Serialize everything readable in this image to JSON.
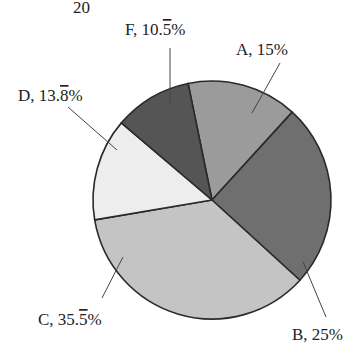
{
  "chart_data": {
    "type": "pie",
    "title": "",
    "top_fragment_text": "20",
    "center": [
      212,
      200
    ],
    "radius": 119,
    "start_angle_deg": -11.6,
    "direction": "clockwise",
    "slices": [
      {
        "label": "A",
        "value": 15.0,
        "display": "A, 15%",
        "color": "#9b9b9b"
      },
      {
        "label": "B",
        "value": 25.0,
        "display": "B, 25%",
        "color": "#6f6f6f"
      },
      {
        "label": "C",
        "value": 35.56,
        "display": "C, 35.5̅%",
        "color": "#c4c4c4"
      },
      {
        "label": "D",
        "value": 13.89,
        "display": "D, 13.8̅%",
        "color": "#ededed"
      },
      {
        "label": "F",
        "value": 10.56,
        "display": "F, 10.5̅%",
        "color": "#555555"
      }
    ],
    "labels": [
      {
        "slice": "A",
        "text_main": "A, 15%",
        "text_x": 236,
        "text_y": 55,
        "line": [
          280,
          63,
          252,
          113
        ]
      },
      {
        "slice": "B",
        "text_main": "B, 25%",
        "text_x": 292,
        "text_y": 340,
        "line": [
          326,
          317,
          303,
          262
        ]
      },
      {
        "slice": "C",
        "text_main": "C, 35.5",
        "overline_digit": "5",
        "text_x": 38,
        "text_y": 325,
        "line": [
          102,
          298,
          123,
          257
        ]
      },
      {
        "slice": "D",
        "text_main": "D, 13.8",
        "overline_digit": "8",
        "text_x": 18,
        "text_y": 101,
        "line": [
          68,
          107,
          117,
          150
        ]
      },
      {
        "slice": "F",
        "text_main": "F, 10.5",
        "overline_digit": "5",
        "text_x": 125,
        "text_y": 35,
        "line": [
          170,
          48,
          170,
          104
        ]
      }
    ],
    "legend": null,
    "units": "%"
  }
}
